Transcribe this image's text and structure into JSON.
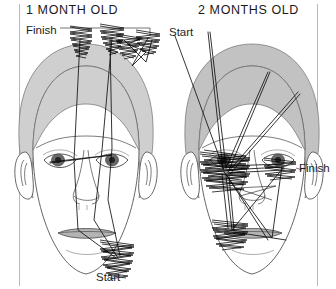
{
  "figure": {
    "kind": "infant-face-scanning-pattern-diagram",
    "background_color": "#ffffff",
    "frame_color": "#b9b9b9"
  },
  "panels": [
    {
      "id": "one-month",
      "title": "1 MONTH OLD",
      "title_x": 26,
      "title_y": 14,
      "annotations": [
        {
          "name": "finish",
          "text": "Finish",
          "x": 26,
          "y": 34
        },
        {
          "name": "start",
          "text": "Start",
          "x": 96,
          "y": 281
        }
      ],
      "face": {
        "fill": "#cfcfcf",
        "outline": "#6e6e6e",
        "center_x": 86,
        "center_y": 175
      },
      "scan_description": "Scanning confined to outer contour: hairline, forehead edge and chin",
      "fixation_clusters": [
        {
          "name": "hairline-left",
          "x": 80,
          "y": 38
        },
        {
          "name": "hairline-center",
          "x": 112,
          "y": 36
        },
        {
          "name": "hairline-right",
          "x": 148,
          "y": 36
        },
        {
          "name": "chin",
          "x": 118,
          "y": 262
        }
      ]
    },
    {
      "id": "two-months",
      "title": "2 MONTHS OLD",
      "title_x": 198,
      "title_y": 14,
      "annotations": [
        {
          "name": "start",
          "text": "Start",
          "x": 169,
          "y": 36
        },
        {
          "name": "finish",
          "text": "Finish",
          "x": 299,
          "y": 172
        }
      ],
      "face": {
        "fill": "#c9c9c9",
        "outline": "#6e6e6e",
        "center_x": 252,
        "center_y": 175
      },
      "scan_description": "Scanning concentrated on internal features: eyes, nose and mouth",
      "fixation_clusters": [
        {
          "name": "left-eye",
          "x": 224,
          "y": 168
        },
        {
          "name": "mouth",
          "x": 229,
          "y": 229
        },
        {
          "name": "right-eye",
          "x": 281,
          "y": 168
        }
      ]
    }
  ],
  "legend": {
    "start_label": "Start",
    "finish_label": "Finish"
  }
}
